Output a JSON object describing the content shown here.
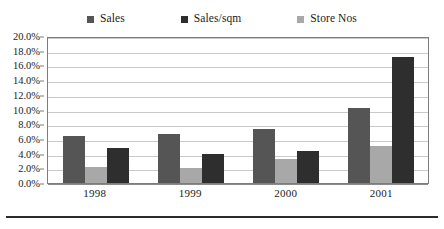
{
  "chart_data": {
    "type": "bar",
    "title": "",
    "subtitle": "",
    "xlabel": "",
    "ylabel": "",
    "categories": [
      "1998",
      "1999",
      "2000",
      "2001"
    ],
    "series": [
      {
        "name": "Sales",
        "color": "#555555",
        "values": [
          6.4,
          6.7,
          7.3,
          10.2
        ]
      },
      {
        "name": "Store Nos",
        "color": "#a8a8a8",
        "values": [
          2.2,
          2.0,
          3.3,
          5.0
        ]
      },
      {
        "name": "Sales/sqm",
        "color": "#2e2e2e",
        "values": [
          4.7,
          4.0,
          4.3,
          17.2
        ]
      }
    ],
    "series_draw_order": [
      "Sales",
      "Store Nos",
      "Sales/sqm"
    ],
    "legend_order": [
      "Sales",
      "Sales/sqm",
      "Store Nos"
    ],
    "ylim": [
      0,
      20
    ],
    "ytick_values": [
      0,
      2,
      4,
      6,
      8,
      10,
      12,
      14,
      16,
      18,
      20
    ],
    "ytick_labels": [
      "0.0%",
      "2.0%",
      "4.0%",
      "6.0%",
      "8.0%",
      "10.0%",
      "12.0%",
      "14.0%",
      "16.0%",
      "18.0%",
      "20.0%"
    ],
    "grid": true,
    "legend_position": "top"
  },
  "legend": {
    "items": [
      {
        "label": "Sales",
        "color": "#555555"
      },
      {
        "label": "Sales/sqm",
        "color": "#2e2e2e"
      },
      {
        "label": "Store Nos",
        "color": "#a8a8a8"
      }
    ]
  }
}
